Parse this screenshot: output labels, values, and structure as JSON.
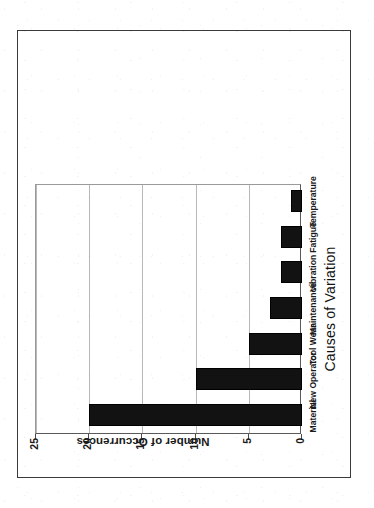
{
  "figure": {
    "orientation_note": "landscape-chart-rotated-90-ccw-on-page",
    "page_background": "#ffffff",
    "frame_color": "#3a3a3a"
  },
  "chart_data": {
    "type": "bar",
    "title": "",
    "orientation": "vertical",
    "categories": [
      "Material",
      "New Operator",
      "Tool Wear",
      "Maintenance",
      "Vibration",
      "Fatigue",
      "Temperature"
    ],
    "values": [
      20,
      10,
      5,
      3,
      2,
      2,
      1
    ],
    "xlabel": "Causes of Variation",
    "ylabel": "Number of Occurrences",
    "ylim": [
      0,
      25
    ],
    "yticks": [
      0,
      5,
      10,
      15,
      20,
      25
    ],
    "ytick_labels": [
      "0",
      "5",
      "10",
      "15",
      "20",
      "25"
    ],
    "grid": true,
    "grid_axis": "y",
    "legend": false,
    "bar_color": "#121212",
    "bar_edge_color": "#000000",
    "gridline_color": "#b8b8b8",
    "axis_color": "#5a5a5a"
  },
  "axis": {
    "value_axis_title": "Number of Occurrences",
    "category_axis_title": "Causes of Variation"
  }
}
